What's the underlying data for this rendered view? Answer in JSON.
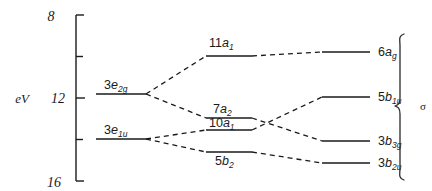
{
  "figure": {
    "kind": "molecular-orbital-correlation-diagram",
    "axis": {
      "title": "eV",
      "tick_labels": [
        "8",
        "12",
        "16"
      ],
      "tick_values": [
        8,
        12,
        16
      ],
      "minor_tick_values": [
        10,
        14
      ],
      "range": [
        8,
        16
      ],
      "inverted": true
    },
    "bracket": {
      "label": "σ",
      "label_name": "sigma"
    },
    "columns": [
      {
        "name": "left",
        "levels": [
          {
            "id": "3e2g",
            "prefix": "3",
            "symbol": "e",
            "sub": "2g",
            "energy": 11.85,
            "label_position": "above"
          },
          {
            "id": "3e1u",
            "prefix": "3",
            "symbol": "e",
            "sub": "1u",
            "energy": 13.85,
            "label_position": "above"
          }
        ]
      },
      {
        "name": "middle",
        "levels": [
          {
            "id": "11a1",
            "prefix": "11",
            "symbol": "a",
            "sub": "1",
            "energy": 10.05,
            "label_position": "above"
          },
          {
            "id": "7a2",
            "prefix": "7",
            "symbol": "a",
            "sub": "2",
            "energy": 12.85,
            "label_position": "above"
          },
          {
            "id": "10a1",
            "prefix": "10",
            "symbol": "a",
            "sub": "1",
            "energy": 13.45,
            "label_position": "above"
          },
          {
            "id": "5b2",
            "prefix": "5",
            "symbol": "b",
            "sub": "2",
            "energy": 14.55,
            "label_position": "below"
          }
        ]
      },
      {
        "name": "right",
        "levels": [
          {
            "id": "6ag",
            "prefix": "6",
            "symbol": "a",
            "sub": "g",
            "energy": 9.95,
            "label_position": "right"
          },
          {
            "id": "5b1u",
            "prefix": "5",
            "symbol": "b",
            "sub": "1u",
            "energy": 11.9,
            "label_position": "right"
          },
          {
            "id": "3b3g",
            "prefix": "3",
            "symbol": "b",
            "sub": "3g",
            "energy": 13.9,
            "label_position": "right"
          },
          {
            "id": "3b2u",
            "prefix": "3",
            "symbol": "b",
            "sub": "2u",
            "energy": 14.95,
            "label_position": "right"
          }
        ]
      }
    ],
    "correlations": [
      {
        "from": "3e2g",
        "to": "11a1"
      },
      {
        "from": "3e2g",
        "to": "7a2"
      },
      {
        "from": "3e1u",
        "to": "10a1"
      },
      {
        "from": "3e1u",
        "to": "5b2"
      },
      {
        "from": "11a1",
        "to": "6ag"
      },
      {
        "from": "7a2",
        "to": "3b3g"
      },
      {
        "from": "10a1",
        "to": "5b1u"
      },
      {
        "from": "5b2",
        "to": "3b2u"
      }
    ]
  },
  "colors": {
    "ink": "#1a1a1a",
    "background": "#ffffff"
  }
}
